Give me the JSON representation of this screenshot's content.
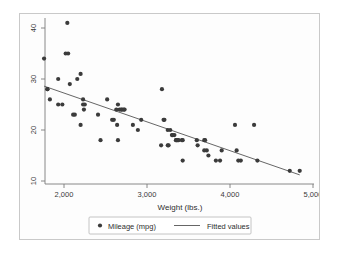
{
  "figure": {
    "background_color": "#ffffff",
    "frame_color": "#c9c9c9",
    "marker_color": "#3b3b3b",
    "line_color": "#555555"
  },
  "axes": {
    "x_title": "Weight (lbs.)",
    "y_title": "",
    "x_ticks": [
      "2,000",
      "3,000",
      "4,000",
      "5,000"
    ],
    "y_ticks": [
      "40",
      "30",
      "20",
      "10"
    ]
  },
  "legend": {
    "entries": [
      {
        "label": "Mileage (mpg)",
        "marker": "dot-marker",
        "color": "#3b3b3b"
      },
      {
        "label": "Fitted values",
        "marker": "line-marker",
        "color": "#555555"
      }
    ]
  },
  "chart_data": {
    "type": "scatter",
    "title": "",
    "xlabel": "Weight (lbs.)",
    "ylabel": "Mileage (mpg)",
    "xlim": [
      1700,
      4900
    ],
    "ylim": [
      9,
      42
    ],
    "xticks": [
      2000,
      3000,
      4000,
      5000
    ],
    "yticks": [
      10,
      20,
      30,
      40
    ],
    "grid": false,
    "legend_position": "bottom-center",
    "series": [
      {
        "name": "Mileage (mpg)",
        "type": "scatter",
        "marker": "circle",
        "color": "#3b3b3b",
        "x": [
          2040,
          2020,
          2050,
          1760,
          1800,
          1800,
          1930,
          2200,
          2070,
          2160,
          2230,
          2230,
          2250,
          2240,
          2520,
          1830,
          1930,
          1980,
          2110,
          2130,
          2410,
          2650,
          2630,
          2670,
          2690,
          2700,
          2720,
          2730,
          2580,
          2600,
          2640,
          2830,
          2930,
          2200,
          2440,
          2650,
          2890,
          3180,
          3200,
          3210,
          3250,
          3280,
          3300,
          3310,
          3330,
          3350,
          3350,
          3360,
          3370,
          3380,
          3420,
          3430,
          3170,
          3250,
          3260,
          3430,
          3600,
          3610,
          3690,
          3700,
          3720,
          3740,
          3690,
          3830,
          3880,
          3900,
          4060,
          4080,
          4100,
          4130,
          4290,
          4330,
          4720,
          4840
        ],
        "y": [
          41,
          35,
          35,
          34,
          28,
          28,
          30,
          31,
          29,
          30,
          26,
          25,
          25,
          24,
          26,
          26,
          25,
          25,
          23,
          23,
          23,
          25,
          24,
          24,
          24,
          24,
          24,
          24,
          22,
          22,
          21,
          21,
          22,
          21,
          18,
          18,
          20,
          28,
          22,
          22,
          20,
          20,
          19,
          19,
          19,
          18,
          18,
          18,
          18,
          18,
          18,
          18,
          17,
          17,
          17,
          14,
          18,
          17,
          18,
          18,
          16,
          15,
          16,
          14,
          14,
          16,
          21,
          16,
          14,
          14,
          21,
          14,
          12,
          12
        ]
      },
      {
        "name": "Fitted values",
        "type": "line",
        "color": "#555555",
        "x": [
          1760,
          4840
        ],
        "y": [
          28.6,
          11.2
        ]
      }
    ]
  }
}
